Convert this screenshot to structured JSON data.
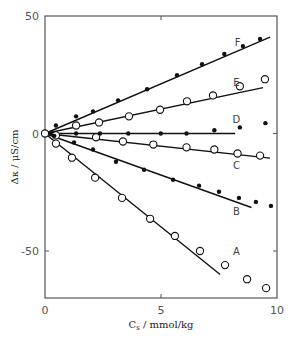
{
  "chart_data": {
    "type": "scatter",
    "title": "",
    "xlabel": "C_s / mmol/kg",
    "xlabel_main": "C",
    "xlabel_sub": "s",
    "xlabel_rest": " / mmol/kg",
    "ylabel": "Δκ / μS/cm",
    "xlim": [
      0,
      10
    ],
    "ylim": [
      -70,
      50
    ],
    "xticks": [
      0,
      5,
      10
    ],
    "yticks": [
      50,
      0,
      -50
    ],
    "grid": false,
    "legend": "inline labels",
    "series": [
      {
        "name": "F",
        "marker": "filled",
        "x": [
          0,
          0.47,
          1.34,
          2.07,
          3.15,
          4.4,
          5.69,
          6.77,
          7.73,
          8.53,
          9.27
        ],
        "y": [
          0,
          3.4,
          7.3,
          9.4,
          14.1,
          18.8,
          24.8,
          29.5,
          33.8,
          37.2,
          40.2
        ],
        "fit_line": [
          [
            0,
            0
          ],
          [
            9.7,
            41
          ]
        ]
      },
      {
        "name": "E",
        "marker": "open",
        "x": [
          1.34,
          2.33,
          3.62,
          4.96,
          6.12,
          7.24,
          8.4,
          9.48
        ],
        "y": [
          3.4,
          4.7,
          7.3,
          10.1,
          13.7,
          16.2,
          20.1,
          23.1
        ],
        "fit_line": [
          [
            0,
            0
          ],
          [
            9.4,
            19.5
          ]
        ]
      },
      {
        "name": "D",
        "marker": "filled",
        "x": [
          0.3,
          1.34,
          2.37,
          3.59,
          4.99,
          6.1,
          7.3,
          8.4,
          9.5
        ],
        "y": [
          0,
          0,
          0,
          0,
          0,
          0,
          1.4,
          2.6,
          4.4
        ],
        "fit_line": [
          [
            0,
            0
          ],
          [
            8.2,
            0
          ]
        ]
      },
      {
        "name": "C",
        "marker": "open",
        "x": [
          0.47,
          2.2,
          3.36,
          4.67,
          6.1,
          7.3,
          8.3,
          9.27
        ],
        "y": [
          -0.8,
          -1.6,
          -3.4,
          -4.7,
          -5.9,
          -6.8,
          -8.5,
          -9.4
        ],
        "fit_line": [
          [
            0,
            0
          ],
          [
            9.7,
            -10.5
          ]
        ]
      },
      {
        "name": "B",
        "marker": "filled",
        "x": [
          0.4,
          1.25,
          2.07,
          3.06,
          4.27,
          5.52,
          6.64,
          7.5,
          8.36,
          9.09,
          9.74
        ],
        "y": [
          -1.0,
          -3.8,
          -6.8,
          -12.0,
          -15.4,
          -19.7,
          -22.2,
          -24.8,
          -27.4,
          -29.1,
          -30.8
        ],
        "fit_line": [
          [
            0,
            0
          ],
          [
            8.9,
            -31.5
          ]
        ]
      },
      {
        "name": "A",
        "marker": "open",
        "x": [
          0,
          0.47,
          1.16,
          2.16,
          3.32,
          4.53,
          5.6,
          6.68,
          7.76,
          8.71,
          9.53
        ],
        "y": [
          0,
          -4.3,
          -10.3,
          -18.8,
          -27.4,
          -36.3,
          -43.6,
          -50.0,
          -56.0,
          -62.0,
          -65.8
        ],
        "fit_line": [
          [
            0,
            0
          ],
          [
            7.55,
            -60
          ]
        ]
      }
    ],
    "series_label_positions": {
      "F": [
        8.3,
        39
      ],
      "E": [
        8.25,
        22
      ],
      "D": [
        8.25,
        6
      ],
      "C": [
        8.25,
        -13.5
      ],
      "B": [
        8.25,
        -33
      ],
      "A": [
        8.25,
        -50
      ]
    }
  }
}
